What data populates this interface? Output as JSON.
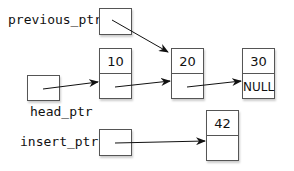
{
  "pointers": {
    "previous_ptr": {
      "label": "previous_ptr"
    },
    "head_ptr": {
      "label": "head_ptr"
    },
    "insert_ptr": {
      "label": "insert_ptr"
    }
  },
  "nodes": [
    {
      "data": "10",
      "link": ""
    },
    {
      "data": "20",
      "link": ""
    },
    {
      "data": "30",
      "link": "NULL"
    },
    {
      "data": "42",
      "link": ""
    }
  ]
}
